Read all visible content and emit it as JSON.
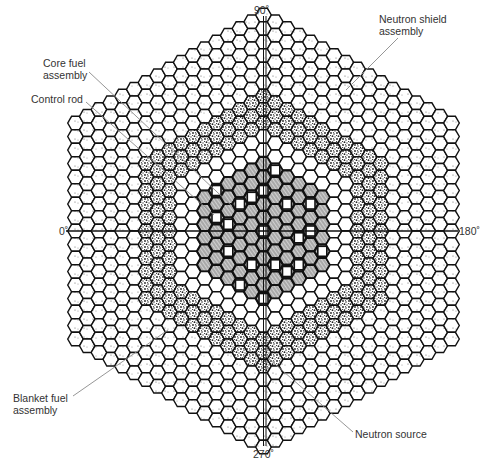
{
  "diagram": {
    "center": [
      263.5,
      231
    ],
    "hex": {
      "width": 15.6,
      "col_step": 11.75,
      "row_step": 13.5,
      "max_ring": 16
    },
    "regions": [
      {
        "name": "core",
        "max_ring": 5,
        "fill": "#9a9a9a",
        "pattern": "hatch"
      },
      {
        "name": "blanket-inner",
        "max_ring": 7,
        "fill": "#ffffff",
        "pattern": "none"
      },
      {
        "name": "blanket-stipple",
        "max_ring": 10,
        "fill": "#ffffff",
        "pattern": "stipple-dark"
      },
      {
        "name": "shield",
        "max_ring": 16,
        "fill": "#ffffff",
        "pattern": "stipple-light"
      }
    ],
    "control_rods": [
      [
        0,
        0
      ],
      [
        0,
        -3
      ],
      [
        2,
        -3
      ],
      [
        3,
        -1
      ],
      [
        3,
        1
      ],
      [
        1,
        2
      ],
      [
        -1,
        3
      ],
      [
        -3,
        3
      ],
      [
        -3,
        1
      ],
      [
        -2,
        -1
      ],
      [
        -4,
        1
      ],
      [
        4,
        -2
      ],
      [
        0,
        5
      ],
      [
        -4,
        -1
      ],
      [
        2,
        2
      ],
      [
        -1,
        -2
      ],
      [
        4,
        -4
      ],
      [
        -2,
        5
      ],
      [
        1,
        -5
      ],
      [
        5,
        -1
      ]
    ],
    "axes": {
      "labels": {
        "top": "90˚",
        "left": "0˚",
        "right": "180˚",
        "bottom": "270˚"
      }
    },
    "callouts": [
      {
        "id": "core-fuel-assembly",
        "text": "Core fuel\nassembly",
        "x": 43,
        "y": 57,
        "line": [
          [
            89,
            72
          ],
          [
            232,
            206
          ]
        ]
      },
      {
        "id": "control-rod",
        "text": "Control rod",
        "x": 31,
        "y": 93,
        "line": [
          [
            86,
            102
          ],
          [
            214,
            215
          ]
        ]
      },
      {
        "id": "neutron-shield-assembly",
        "text": "Neutron shield\nassembly",
        "x": 379,
        "y": 13,
        "line": [
          [
            398,
            38
          ],
          [
            346,
            90
          ]
        ]
      },
      {
        "id": "blanket-fuel-assembly",
        "text": "Blanket fuel\nassembly",
        "x": 13,
        "y": 393,
        "line": [
          [
            73,
            396
          ],
          [
            168,
            330
          ]
        ]
      },
      {
        "id": "neutron-source",
        "text": "Neutron source",
        "x": 355,
        "y": 428,
        "line": [
          [
            353,
            432
          ],
          [
            268,
            358
          ]
        ]
      }
    ],
    "colors": {
      "line": "#111111",
      "leader": "#8a8a8a",
      "text": "#333333",
      "core": "#9a9a9a"
    }
  }
}
